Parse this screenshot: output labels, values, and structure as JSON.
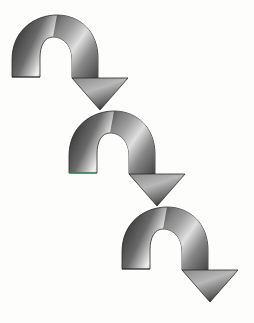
{
  "diagram": {
    "title": "",
    "type": "cascading-curved-arrows",
    "background": "#fdfdfb",
    "arrow_count": 3,
    "arrows": [
      {
        "id": 1,
        "offset_x": 0,
        "offset_y": 0,
        "icon": "curved-down-arrow-icon"
      },
      {
        "id": 2,
        "offset_x": 57,
        "offset_y": 96,
        "icon": "curved-down-arrow-icon"
      },
      {
        "id": 3,
        "offset_x": 114,
        "offset_y": 192,
        "icon": "curved-down-arrow-icon"
      }
    ],
    "colors": {
      "metal_dark": "#1e1e1e",
      "metal_mid": "#7a7a7a",
      "metal_light": "#f2f2f2",
      "outline": "#2a2a2a",
      "accent_edge": "#3cb878"
    }
  }
}
